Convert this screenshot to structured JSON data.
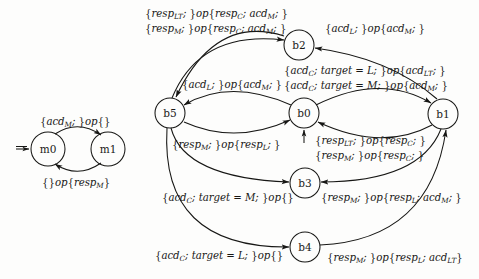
{
  "figure": {
    "kind": "state-machine-diagram",
    "machines": [
      {
        "name": "left-machine",
        "states": [
          {
            "id": "m0",
            "label": "m0",
            "cx": 48,
            "cy": 149,
            "r": 17,
            "initial": true
          },
          {
            "id": "m1",
            "label": "m1",
            "cx": 108,
            "cy": 149,
            "r": 17,
            "initial": false
          }
        ]
      },
      {
        "name": "right-machine",
        "states": [
          {
            "id": "b5",
            "label": "b5",
            "cx": 170,
            "cy": 113,
            "r": 15,
            "initial": false
          },
          {
            "id": "b0",
            "label": "b0",
            "cx": 304,
            "cy": 113,
            "r": 15,
            "initial": true
          },
          {
            "id": "b1",
            "label": "b1",
            "cx": 443,
            "cy": 114,
            "r": 15,
            "initial": false
          },
          {
            "id": "b2",
            "label": "b2",
            "cx": 299,
            "cy": 45,
            "r": 15,
            "initial": false
          },
          {
            "id": "b3",
            "label": "b3",
            "cx": 305,
            "cy": 183,
            "r": 15,
            "initial": false
          },
          {
            "id": "b4",
            "label": "b4",
            "cx": 305,
            "cy": 247,
            "r": 15,
            "initial": false
          }
        ]
      }
    ],
    "edge_labels": [
      {
        "id": "m0-to-m1",
        "lines": [
          "{acd_M; }op{}"
        ],
        "x": 40,
        "y": 116
      },
      {
        "id": "m1-to-m0",
        "lines": [
          "{}op{resp_M}"
        ],
        "x": 42,
        "y": 177
      },
      {
        "id": "b5-to-b2",
        "lines": [
          "{resp_LT; }op{resp_C; acd_M; }",
          "{resp_M; }op{resp_C; acd_M; }"
        ],
        "x": 145,
        "y": 8
      },
      {
        "id": "b1-to-b2",
        "lines": [
          "{acd_L; }op{acd_M; }"
        ],
        "x": 325,
        "y": 23
      },
      {
        "id": "b0-to-b5",
        "lines": [
          "{acd_L; }op{acd_M; }"
        ],
        "x": 182,
        "y": 79
      },
      {
        "id": "b0-to-b1",
        "lines": [
          "{acd_C; target = L; }op{acd_LT; }",
          "{acd_C; target = M; }op{acd_M; }"
        ],
        "x": 284,
        "y": 65
      },
      {
        "id": "b5-to-b0",
        "lines": [
          "{resp_M; }op{resp_L; }"
        ],
        "x": 172,
        "y": 139
      },
      {
        "id": "b1-to-b0",
        "lines": [
          "{resp_LT; }op{resp_C; }",
          "{resp_M; }op{resp_C; }"
        ],
        "x": 315,
        "y": 135
      },
      {
        "id": "b5-to-b3",
        "lines": [
          "{acd_C; target = M; }op{}"
        ],
        "x": 162,
        "y": 192
      },
      {
        "id": "b1-to-b3",
        "lines": [
          "{resp_M; }op{resp_L; acd_M; }"
        ],
        "x": 321,
        "y": 192
      },
      {
        "id": "b5-to-b4",
        "lines": [
          "{acd_C; target = L; }op{}"
        ],
        "x": 155,
        "y": 250
      },
      {
        "id": "b4-to-b1",
        "lines": [
          "{resp_M; }op{resp_L; acd_LT}"
        ],
        "x": 327,
        "y": 252
      }
    ]
  },
  "colors": {
    "ink": "#171715",
    "paper": "#fdfdfc"
  }
}
